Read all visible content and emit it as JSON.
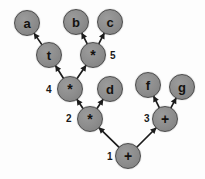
{
  "diagram": {
    "node_fill": "#8c8c8c",
    "node_stroke": "#4a4a4a",
    "edge_color": "#1c1c1c",
    "background": "#fdfdfd",
    "nodes": [
      {
        "id": "a",
        "label": "a",
        "cx": 27,
        "cy": 23,
        "r": 13,
        "font": 13,
        "kind": "leaf"
      },
      {
        "id": "b",
        "label": "b",
        "cx": 76,
        "cy": 22,
        "r": 13,
        "font": 13,
        "kind": "leaf"
      },
      {
        "id": "c",
        "label": "c",
        "cx": 110,
        "cy": 22,
        "r": 13,
        "font": 13,
        "kind": "leaf"
      },
      {
        "id": "t",
        "label": "t",
        "cx": 49,
        "cy": 55,
        "r": 13,
        "font": 13,
        "kind": "operator"
      },
      {
        "id": "m5",
        "label": "*",
        "cx": 93,
        "cy": 55,
        "r": 13,
        "font": 14,
        "kind": "operator"
      },
      {
        "id": "m4",
        "label": "*",
        "cx": 70,
        "cy": 89,
        "r": 13,
        "font": 14,
        "kind": "operator"
      },
      {
        "id": "d",
        "label": "d",
        "cx": 110,
        "cy": 89,
        "r": 13,
        "font": 13,
        "kind": "leaf"
      },
      {
        "id": "f",
        "label": "f",
        "cx": 148,
        "cy": 85,
        "r": 13,
        "font": 13,
        "kind": "leaf"
      },
      {
        "id": "g",
        "label": "g",
        "cx": 182,
        "cy": 87,
        "r": 13,
        "font": 13,
        "kind": "leaf"
      },
      {
        "id": "m2",
        "label": "*",
        "cx": 90,
        "cy": 119,
        "r": 13,
        "font": 14,
        "kind": "operator"
      },
      {
        "id": "p3",
        "label": "+",
        "cx": 165,
        "cy": 119,
        "r": 13,
        "font": 14,
        "kind": "operator"
      },
      {
        "id": "p1",
        "label": "+",
        "cx": 128,
        "cy": 156,
        "r": 13,
        "font": 14,
        "kind": "operator"
      }
    ],
    "weights": [
      {
        "id": "w1",
        "text": "1",
        "x": 107,
        "y": 152,
        "font": 10
      },
      {
        "id": "w2",
        "text": "2",
        "x": 66,
        "y": 114,
        "font": 10
      },
      {
        "id": "w3",
        "text": "3",
        "x": 144,
        "y": 114,
        "font": 10
      },
      {
        "id": "w4",
        "text": "4",
        "x": 46,
        "y": 85,
        "font": 10
      },
      {
        "id": "w5",
        "text": "5",
        "x": 110,
        "y": 51,
        "font": 10
      }
    ],
    "edges": [
      {
        "id": "e-t-a",
        "from": "t",
        "to": "a",
        "arrow": "to-child"
      },
      {
        "id": "e-m5-b",
        "from": "m5",
        "to": "b",
        "arrow": "to-child"
      },
      {
        "id": "e-m5-c",
        "from": "m5",
        "to": "c",
        "arrow": "to-child"
      },
      {
        "id": "e-m4-t",
        "from": "m4",
        "to": "t",
        "arrow": "to-child"
      },
      {
        "id": "e-m4-m5",
        "from": "m4",
        "to": "m5",
        "arrow": "to-child"
      },
      {
        "id": "e-m2-m4",
        "from": "m2",
        "to": "m4",
        "arrow": "to-child"
      },
      {
        "id": "e-m2-d",
        "from": "m2",
        "to": "d",
        "arrow": "to-child"
      },
      {
        "id": "e-p3-f",
        "from": "p3",
        "to": "f",
        "arrow": "to-child"
      },
      {
        "id": "e-p3-g",
        "from": "p3",
        "to": "g",
        "arrow": "to-child"
      },
      {
        "id": "e-p1-m2",
        "from": "p1",
        "to": "m2",
        "arrow": "to-child"
      },
      {
        "id": "e-p1-p3",
        "from": "p1",
        "to": "p3",
        "arrow": "to-child"
      }
    ]
  }
}
